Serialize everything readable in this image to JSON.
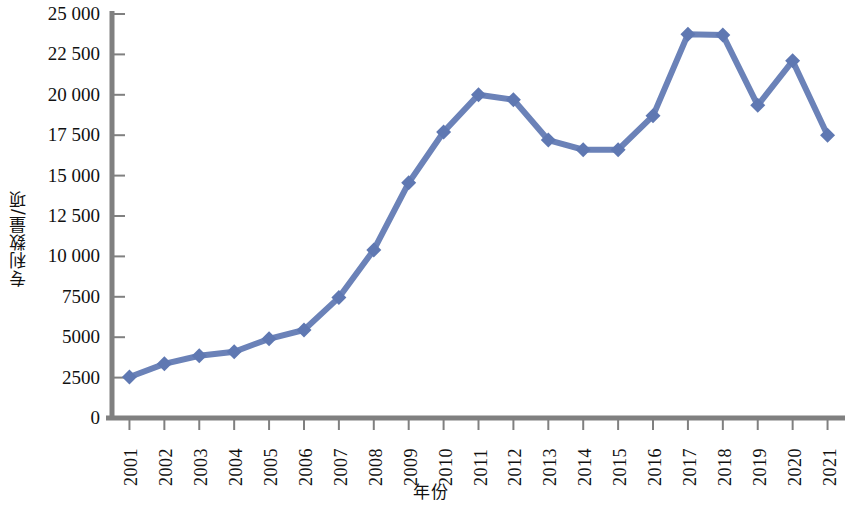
{
  "chart_data": {
    "type": "line",
    "title": "",
    "xlabel": "年份",
    "ylabel": "专利数量/项",
    "categories": [
      "2001",
      "2002",
      "2003",
      "2004",
      "2005",
      "2006",
      "2007",
      "2008",
      "2009",
      "2010",
      "2011",
      "2012",
      "2013",
      "2014",
      "2015",
      "2016",
      "2017",
      "2018",
      "2019",
      "2020",
      "2021"
    ],
    "values": [
      2540,
      3350,
      3850,
      4100,
      4900,
      5450,
      7450,
      10400,
      14550,
      17700,
      20000,
      19700,
      17200,
      16600,
      16600,
      18700,
      23750,
      23700,
      19350,
      22100,
      17500
    ],
    "series": [
      {
        "name": "专利数量",
        "values": [
          2540,
          3350,
          3850,
          4100,
          4900,
          5450,
          7450,
          10400,
          14550,
          17700,
          20000,
          19700,
          17200,
          16600,
          16600,
          18700,
          23750,
          23700,
          19350,
          22100,
          17500
        ]
      }
    ],
    "ylim": [
      0,
      25000
    ],
    "ytick_values": [
      0,
      2500,
      5000,
      7500,
      10000,
      12500,
      15000,
      17500,
      20000,
      22500,
      25000
    ],
    "ytick_labels": [
      "0",
      "2500",
      "5000",
      "7500",
      "10 000",
      "12 500",
      "15 000",
      "17 500",
      "20 000",
      "22 500",
      "25 000"
    ],
    "grid": false,
    "legend": "none",
    "marker": "diamond",
    "colors": {
      "line": "#6B82B8",
      "marker": "#5F78B2",
      "axis": "#808080",
      "text": "#111111",
      "background": "#FFFFFF"
    }
  }
}
